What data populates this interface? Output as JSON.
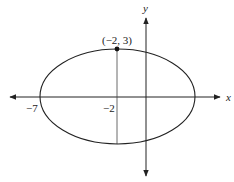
{
  "diagram": {
    "type": "ellipse-on-axes",
    "x_axis_label": "x",
    "y_axis_label": "y",
    "point_label": "(−2, 3)",
    "tick_labels": {
      "left_vertex": "−7",
      "center_x": "−2"
    },
    "ellipse": {
      "center": [
        -2,
        0
      ],
      "vertex_left": [
        -7,
        0
      ],
      "co_vertex_top": [
        -2,
        3
      ]
    },
    "colors": {
      "stroke": "#222222",
      "background": "#ffffff"
    }
  }
}
